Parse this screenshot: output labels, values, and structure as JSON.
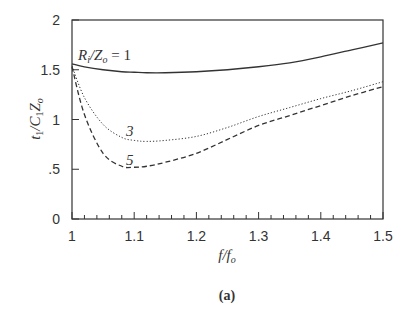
{
  "chart_data": {
    "type": "line",
    "title": "",
    "caption": "(a)",
    "xlabel": "f/f_o",
    "ylabel": "t_1/C_1 Z_o",
    "xlim": [
      1.0,
      1.5
    ],
    "ylim": [
      0,
      2
    ],
    "grid": false,
    "x_ticks": [
      1,
      1.1,
      1.2,
      1.3,
      1.4,
      1.5
    ],
    "x_tick_labels": [
      "1",
      "1.1",
      "1.2",
      "1.3",
      "1.4",
      "1.5"
    ],
    "y_ticks": [
      0,
      0.5,
      1,
      1.5,
      2
    ],
    "y_tick_labels": [
      "0",
      ".5",
      "1",
      "1.5",
      "2"
    ],
    "x": [
      1.0,
      1.02,
      1.05,
      1.08,
      1.1,
      1.12,
      1.15,
      1.2,
      1.25,
      1.3,
      1.35,
      1.4,
      1.45,
      1.5
    ],
    "series": [
      {
        "name": "R_i/Z_o = 1",
        "label": "R_i/Z_o = 1",
        "style": "solid",
        "values": [
          1.56,
          1.53,
          1.5,
          1.48,
          1.475,
          1.47,
          1.47,
          1.48,
          1.5,
          1.53,
          1.57,
          1.63,
          1.7,
          1.77
        ]
      },
      {
        "name": "R_i/Z_o = 3",
        "label": "3",
        "style": "dotted",
        "values": [
          1.54,
          1.22,
          0.95,
          0.82,
          0.79,
          0.78,
          0.79,
          0.83,
          0.92,
          1.03,
          1.12,
          1.21,
          1.29,
          1.38
        ]
      },
      {
        "name": "R_i/Z_o = 5",
        "label": "5",
        "style": "dashed",
        "values": [
          1.53,
          1.05,
          0.66,
          0.53,
          0.52,
          0.53,
          0.57,
          0.66,
          0.8,
          0.94,
          1.04,
          1.14,
          1.24,
          1.33
        ]
      }
    ],
    "annotations": [
      {
        "text": "R_i/Z_o = 1",
        "x": 1.01,
        "y": 1.62
      },
      {
        "text": "3",
        "x": 1.06,
        "y": 0.87
      },
      {
        "text": "5",
        "x": 1.06,
        "y": 0.58
      }
    ]
  }
}
